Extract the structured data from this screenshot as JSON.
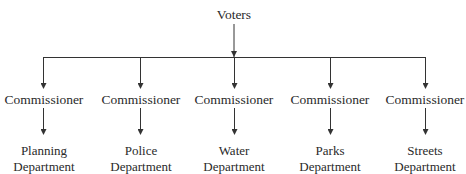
{
  "diagram": {
    "type": "org-chart",
    "root": {
      "label": "Voters"
    },
    "branches": [
      {
        "commissioner": "Commissioner",
        "department_line1": "Planning",
        "department_line2": "Department"
      },
      {
        "commissioner": "Commissioner",
        "department_line1": "Police",
        "department_line2": "Department"
      },
      {
        "commissioner": "Commissioner",
        "department_line1": "Water",
        "department_line2": "Department"
      },
      {
        "commissioner": "Commissioner",
        "department_line1": "Parks",
        "department_line2": "Department"
      },
      {
        "commissioner": "Commissioner",
        "department_line1": "Streets",
        "department_line2": "Department"
      }
    ],
    "colors": {
      "line": "#333333",
      "text": "#2a2a2a",
      "background": "#ffffff"
    }
  }
}
